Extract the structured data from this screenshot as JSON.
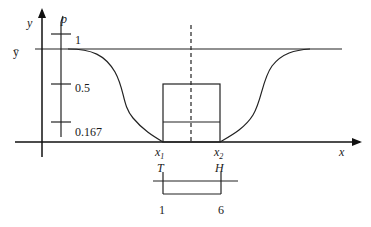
{
  "diagram": {
    "axes": {
      "y_label": "y",
      "p_label": "p",
      "x_label": "x",
      "ybar_label": "ȳ"
    },
    "p_ticks": [
      {
        "label": "1",
        "value": 1
      },
      {
        "label": "0.5",
        "value": 0.5
      },
      {
        "label": "0.167",
        "value": 0.167
      }
    ],
    "x_marks": [
      {
        "label": "x",
        "sub": "1",
        "letter": "T",
        "number": "1"
      },
      {
        "label": "x",
        "sub": "2",
        "letter": "H",
        "number": "6"
      }
    ],
    "colors": {
      "stroke": "#222222",
      "background": "#ffffff"
    }
  }
}
